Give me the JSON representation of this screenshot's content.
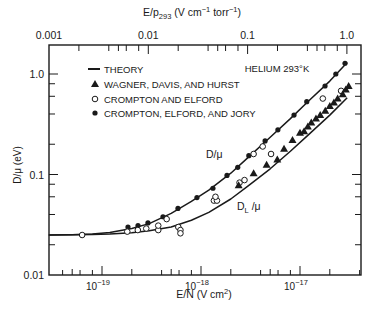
{
  "chart_data": {
    "type": "scatter",
    "title": "HELIUM 293°K",
    "xlabel": "E/N (V cm²)",
    "xlabel_parts": {
      "base": "E/N (V cm",
      "sup": "2",
      "end": ")"
    },
    "ylabel": "D/μ (eV)",
    "top_xlabel": "E/p293 (V cm⁻¹ torr⁻¹)",
    "top_xlabel_parts": {
      "a": "E/p",
      "sub": "293",
      "b": " (V cm",
      "sup1": "−1",
      "c": "  torr",
      "sup2": "−1",
      "d": ")"
    },
    "x_scale": "log",
    "y_scale": "log",
    "xlim": [
      2.9e-20,
      4.1e-17
    ],
    "ylim": [
      0.01,
      1.8
    ],
    "top_xlim": [
      0.001,
      1.4
    ],
    "grid": false,
    "legend_position": "upper left",
    "x_ticks": [
      {
        "value": 1e-19,
        "label": "10",
        "exp": "−19"
      },
      {
        "value": 1e-18,
        "label": "10",
        "exp": "−18"
      },
      {
        "value": 1e-17,
        "label": "10",
        "exp": "−17"
      }
    ],
    "top_ticks": [
      {
        "value": 0.001,
        "label": "0.001"
      },
      {
        "value": 0.01,
        "label": "0.01"
      },
      {
        "value": 0.1,
        "label": "0.1"
      },
      {
        "value": 1.0,
        "label": "1.0"
      }
    ],
    "y_ticks": [
      {
        "value": 0.01,
        "label": "0.01"
      },
      {
        "value": 0.1,
        "label": "0.1"
      },
      {
        "value": 1.0,
        "label": "1.0"
      }
    ],
    "legend": [
      {
        "marker": "line",
        "label": "THEORY"
      },
      {
        "marker": "triangle",
        "label": "WAGNER, DAVIS, AND HURST"
      },
      {
        "marker": "open-circle",
        "label": "CROMPTON AND ELFORD"
      },
      {
        "marker": "filled-circle",
        "label": "CROMPTON, ELFORD, AND JORY"
      }
    ],
    "annotations": [
      {
        "text": "D/μ",
        "x": 1.55e-18,
        "y": 0.135
      },
      {
        "text": "D",
        "sub": "L",
        "after": " /μ",
        "x": 2.3e-18,
        "y": 0.052
      }
    ],
    "series": [
      {
        "name": "THEORY D/μ",
        "type": "line",
        "x": [
          2.9e-20,
          5e-20,
          8e-20,
          1.2e-19,
          2e-19,
          3e-19,
          5e-19,
          8e-19,
          1.2e-18,
          2e-18,
          3e-18,
          5e-18,
          8e-18,
          1.2e-17,
          2e-17,
          3e-17
        ],
        "y": [
          0.025,
          0.0252,
          0.0256,
          0.0265,
          0.029,
          0.0325,
          0.041,
          0.054,
          0.07,
          0.103,
          0.148,
          0.235,
          0.36,
          0.53,
          0.85,
          1.3
        ]
      },
      {
        "name": "THEORY D_L/μ",
        "type": "line",
        "x": [
          2.9e-20,
          5e-20,
          8e-20,
          1.2e-19,
          2e-19,
          3e-19,
          5e-19,
          8e-19,
          1.2e-18,
          2e-18,
          3e-18,
          5e-18,
          8e-18,
          1.2e-17,
          2e-17,
          3e-17
        ],
        "y": [
          0.025,
          0.0251,
          0.0253,
          0.0256,
          0.0263,
          0.0275,
          0.03,
          0.035,
          0.042,
          0.057,
          0.077,
          0.114,
          0.17,
          0.245,
          0.39,
          0.58
        ]
      },
      {
        "name": "CROMPTON, ELFORD, AND JORY",
        "marker": "filled-circle",
        "x": [
          1.83e-19,
          2.31e-19,
          2.91e-19,
          4.13e-19,
          5.85e-19,
          9.1e-19,
          1.32e-18,
          1.83e-18,
          2.35e-18,
          3.04e-18,
          4.44e-18,
          5.98e-18,
          8.7e-18,
          1.17e-17,
          1.79e-17,
          2.3e-17,
          2.85e-17
        ],
        "y": [
          0.03,
          0.031,
          0.033,
          0.038,
          0.046,
          0.059,
          0.073,
          0.098,
          0.118,
          0.154,
          0.216,
          0.278,
          0.39,
          0.53,
          0.76,
          1.0,
          1.28
        ]
      },
      {
        "name": "CROMPTON AND ELFORD",
        "marker": "open-circle",
        "x": [
          6.3e-20,
          1.8e-19,
          2.3e-19,
          2.8e-19,
          3.7e-19,
          3.7e-19,
          4.5e-19,
          5.9e-19,
          6.2e-19,
          6.2e-19,
          1.35e-18,
          1.45e-18,
          1.4e-18,
          2.45e-18,
          2.75e-18,
          3.4e-18,
          4.2e-18,
          5.1e-18,
          1.7e-17,
          2.6e-17
        ],
        "y": [
          0.025,
          0.027,
          0.028,
          0.029,
          0.028,
          0.031,
          0.036,
          0.03,
          0.028,
          0.026,
          0.055,
          0.055,
          0.06,
          0.083,
          0.088,
          0.16,
          0.19,
          0.16,
          0.57,
          0.68
        ]
      },
      {
        "name": "WAGNER, DAVIS, AND HURST",
        "marker": "triangle",
        "x": [
          2.4e-18,
          3.4e-18,
          4.6e-18,
          5.9e-18,
          6.9e-18,
          8.4e-18,
          1e-17,
          1.1e-17,
          1.2e-17,
          1.3e-17,
          1.45e-17,
          1.6e-17,
          1.8e-17,
          2e-17,
          2.2e-17,
          2.4e-17,
          2.7e-17,
          2.9e-17,
          3.1e-17
        ],
        "y": [
          0.078,
          0.103,
          0.125,
          0.141,
          0.18,
          0.22,
          0.26,
          0.27,
          0.3,
          0.33,
          0.36,
          0.39,
          0.43,
          0.48,
          0.52,
          0.57,
          0.63,
          0.7,
          0.76
        ]
      }
    ]
  }
}
